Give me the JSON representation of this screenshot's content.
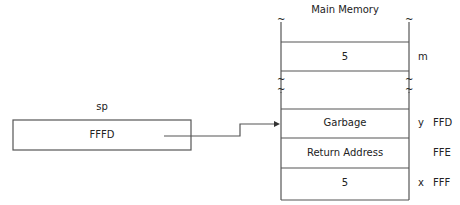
{
  "title": "Main Memory",
  "register": {
    "label": "sp",
    "value": "FFFD"
  },
  "memory_top": {
    "value": "5",
    "var": "m"
  },
  "stack": [
    {
      "value": "Garbage",
      "var": "y",
      "addr": "FFD"
    },
    {
      "value": "Return Address",
      "var": "",
      "addr": "FFE"
    },
    {
      "value": "5",
      "var": "x",
      "addr": "FFF"
    }
  ],
  "break_symbol": "~",
  "colors": {
    "line": "#555555",
    "text": "#222222"
  }
}
